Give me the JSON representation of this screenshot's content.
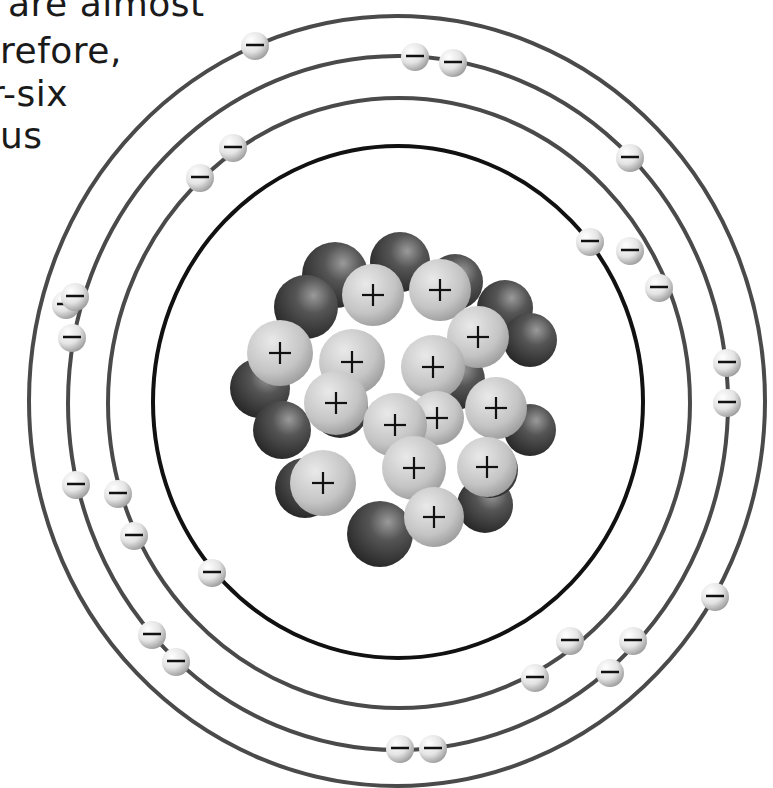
{
  "caption_fragment": {
    "lines": [
      {
        "text": "are almost",
        "x": 8,
        "y": -14
      },
      {
        "text": "refore,",
        "x": 0,
        "y": 33
      },
      {
        "text": "r-six",
        "x": -10,
        "y": 76
      },
      {
        "text": "us",
        "x": 0,
        "y": 118
      }
    ]
  },
  "colors": {
    "orbit_outer": "#4a4a4a",
    "orbit_inner": "#111111",
    "proton": "#c8c8c8",
    "neutron": "#3a3a3a",
    "electron": "#e8e8e8",
    "sign": "#111111"
  },
  "diagram": {
    "orbits": [
      {
        "name": "shell-4",
        "cx": 397,
        "cy": 401,
        "rx": 368,
        "ry": 385,
        "width": 4,
        "color": "#4a4a4a"
      },
      {
        "name": "shell-3",
        "cx": 398,
        "cy": 403,
        "rx": 330,
        "ry": 347,
        "width": 4,
        "color": "#4a4a4a"
      },
      {
        "name": "shell-2",
        "cx": 399,
        "cy": 403,
        "rx": 291,
        "ry": 305,
        "width": 4,
        "color": "#4a4a4a"
      },
      {
        "name": "shell-1",
        "cx": 398,
        "cy": 402,
        "rx": 245,
        "ry": 256,
        "width": 4,
        "color": "#111111"
      }
    ],
    "electron_sign": "−",
    "electrons": [
      {
        "x": 255,
        "y": 46
      },
      {
        "x": 630,
        "y": 158
      },
      {
        "x": 715,
        "y": 597
      },
      {
        "x": 66,
        "y": 305
      },
      {
        "x": 415,
        "y": 57
      },
      {
        "x": 453,
        "y": 63
      },
      {
        "x": 727,
        "y": 363
      },
      {
        "x": 727,
        "y": 403
      },
      {
        "x": 75,
        "y": 297
      },
      {
        "x": 72,
        "y": 338
      },
      {
        "x": 76,
        "y": 485
      },
      {
        "x": 633,
        "y": 641
      },
      {
        "x": 610,
        "y": 673
      },
      {
        "x": 400,
        "y": 749
      },
      {
        "x": 433,
        "y": 749
      },
      {
        "x": 233,
        "y": 148
      },
      {
        "x": 200,
        "y": 178
      },
      {
        "x": 630,
        "y": 251
      },
      {
        "x": 659,
        "y": 288
      },
      {
        "x": 118,
        "y": 494
      },
      {
        "x": 134,
        "y": 536
      },
      {
        "x": 152,
        "y": 635
      },
      {
        "x": 176,
        "y": 662
      },
      {
        "x": 570,
        "y": 641
      },
      {
        "x": 535,
        "y": 678
      },
      {
        "x": 590,
        "y": 242
      },
      {
        "x": 212,
        "y": 573
      }
    ],
    "nucleus": {
      "neutrons": [
        {
          "x": 335,
          "y": 275,
          "r": 33
        },
        {
          "x": 400,
          "y": 262,
          "r": 30
        },
        {
          "x": 455,
          "y": 282,
          "r": 28
        },
        {
          "x": 306,
          "y": 307,
          "r": 32
        },
        {
          "x": 505,
          "y": 308,
          "r": 28
        },
        {
          "x": 530,
          "y": 340,
          "r": 27
        },
        {
          "x": 260,
          "y": 388,
          "r": 30
        },
        {
          "x": 282,
          "y": 430,
          "r": 29
        },
        {
          "x": 530,
          "y": 430,
          "r": 26
        },
        {
          "x": 305,
          "y": 488,
          "r": 30
        },
        {
          "x": 380,
          "y": 534,
          "r": 33
        },
        {
          "x": 485,
          "y": 505,
          "r": 28
        },
        {
          "x": 455,
          "y": 380,
          "r": 30
        },
        {
          "x": 340,
          "y": 410,
          "r": 28
        },
        {
          "x": 490,
          "y": 470,
          "r": 28
        }
      ],
      "protons": [
        {
          "x": 373,
          "y": 295,
          "r": 31,
          "sign": "+"
        },
        {
          "x": 440,
          "y": 290,
          "r": 31,
          "sign": "+"
        },
        {
          "x": 478,
          "y": 337,
          "r": 31,
          "sign": "+"
        },
        {
          "x": 280,
          "y": 353,
          "r": 33,
          "sign": "+"
        },
        {
          "x": 352,
          "y": 362,
          "r": 33,
          "sign": "+"
        },
        {
          "x": 433,
          "y": 367,
          "r": 32,
          "sign": "+"
        },
        {
          "x": 336,
          "y": 403,
          "r": 32,
          "sign": "+"
        },
        {
          "x": 437,
          "y": 418,
          "r": 27,
          "sign": "+"
        },
        {
          "x": 496,
          "y": 408,
          "r": 31,
          "sign": "+"
        },
        {
          "x": 395,
          "y": 425,
          "r": 32,
          "sign": "+"
        },
        {
          "x": 414,
          "y": 468,
          "r": 32,
          "sign": "+"
        },
        {
          "x": 487,
          "y": 467,
          "r": 30,
          "sign": "+"
        },
        {
          "x": 323,
          "y": 483,
          "r": 33,
          "sign": "+"
        },
        {
          "x": 434,
          "y": 517,
          "r": 30,
          "sign": "+"
        }
      ]
    }
  }
}
